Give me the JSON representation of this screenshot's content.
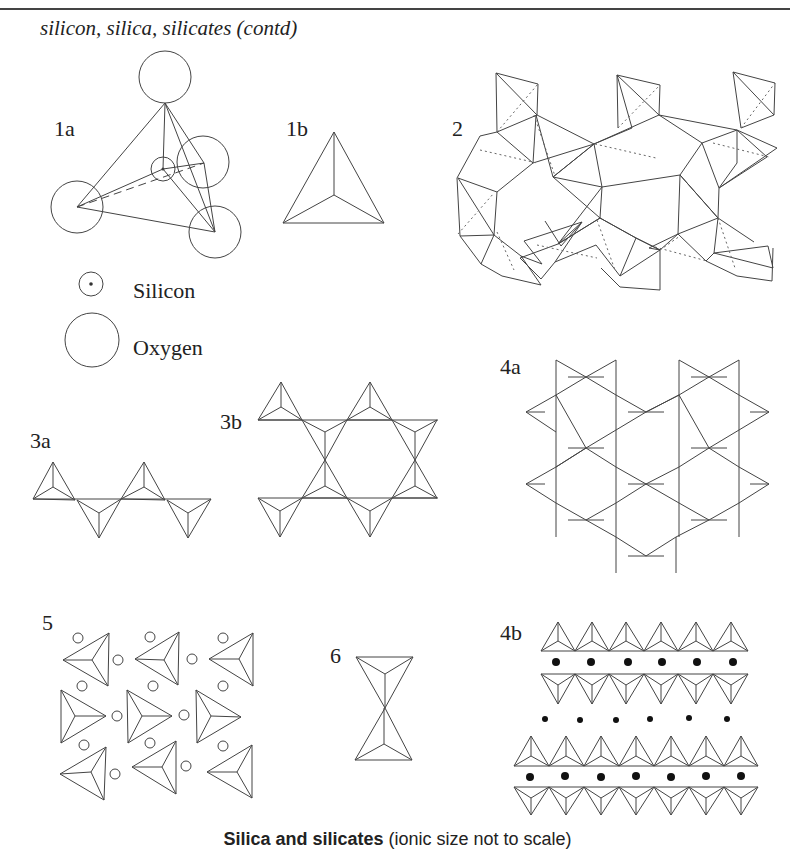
{
  "header": {
    "title": "silicon, silica, silicates (contd)"
  },
  "figures": {
    "f1a": {
      "label": "1a"
    },
    "f1b": {
      "label": "1b"
    },
    "f2": {
      "label": "2"
    },
    "f3a": {
      "label": "3a"
    },
    "f3b": {
      "label": "3b"
    },
    "f4a": {
      "label": "4a"
    },
    "f4b": {
      "label": "4b"
    },
    "f5": {
      "label": "5"
    },
    "f6": {
      "label": "6"
    }
  },
  "legend": {
    "items": [
      {
        "icon": "silicon-atom-icon",
        "label": "Silicon"
      },
      {
        "icon": "oxygen-atom-icon",
        "label": "Oxygen"
      }
    ]
  },
  "caption": {
    "bold": "Silica and silicates",
    "rest": " (ionic size not to scale)"
  },
  "colors": {
    "line": "#444444",
    "background": "#ffffff"
  }
}
